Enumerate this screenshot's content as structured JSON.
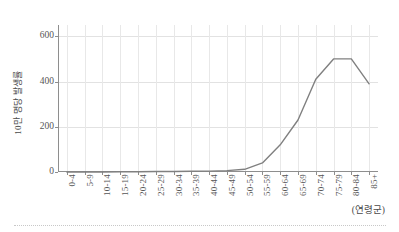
{
  "chart_data": {
    "type": "line",
    "title": "",
    "subtitle": "",
    "xlabel": "(연령군)",
    "ylabel": "10만 명당 발생률",
    "categories": [
      "0-4",
      "5-9",
      "10-14",
      "15-19",
      "20-24",
      "25-29",
      "30-34",
      "35-39",
      "40-44",
      "45-49",
      "50-54",
      "55-59",
      "60-64",
      "65-69",
      "70-74",
      "75-79",
      "80-84",
      "85+"
    ],
    "values": [
      0,
      0,
      0,
      1,
      1,
      2,
      2,
      3,
      4,
      6,
      12,
      40,
      120,
      230,
      410,
      500,
      500,
      390
    ],
    "series": [
      {
        "name": "10만 명당 발생률",
        "values": [
          0,
          0,
          0,
          1,
          1,
          2,
          2,
          3,
          4,
          6,
          12,
          40,
          120,
          230,
          410,
          500,
          500,
          390
        ],
        "color": "#808080"
      }
    ],
    "ylim": [
      0,
      650
    ],
    "yticks": [
      0,
      200,
      400,
      600
    ],
    "ytick_labels": [
      "0",
      "200",
      "400",
      "600"
    ],
    "grid": true,
    "grid_axis": "both",
    "legend": false,
    "legend_position": "none",
    "annotations": []
  },
  "axes": {
    "y_title": "10만 명당 발생률",
    "x_note": "(연령군)"
  }
}
